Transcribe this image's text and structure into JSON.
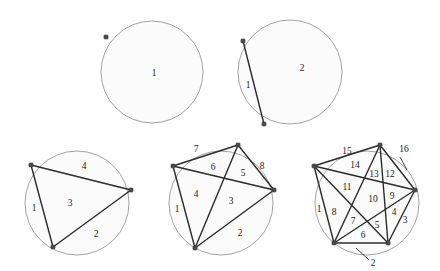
{
  "figure": {
    "background_color": "#ffffff",
    "circle_fill": "#fbfbfb",
    "circle_stroke": "#9a9a9a",
    "chord_color": "#2b2b2b",
    "vertex_color": "#4a4a4a",
    "label_color": "#1c1c1c",
    "panels": [
      {
        "name": "panel-1-point",
        "points_count": 1,
        "regions_count": 1,
        "center": {
          "x": 152,
          "y": 72
        },
        "radius": 51,
        "vertices": [
          {
            "x": 106,
            "y": 37
          }
        ],
        "chords": [],
        "region_labels": [
          {
            "text": "1",
            "x": 154,
            "y": 74
          }
        ],
        "leaders": []
      },
      {
        "name": "panel-2-points",
        "points_count": 2,
        "regions_count": 2,
        "center": {
          "x": 290,
          "y": 72
        },
        "radius": 52,
        "vertices": [
          {
            "x": 243,
            "y": 41
          },
          {
            "x": 264,
            "y": 124
          }
        ],
        "chords": [
          {
            "from": 0,
            "to": 1
          }
        ],
        "region_labels": [
          {
            "text": "1",
            "x": 248,
            "y": 86
          },
          {
            "text": "2",
            "x": 302,
            "y": 69
          }
        ],
        "leaders": []
      },
      {
        "name": "panel-3-points",
        "points_count": 3,
        "regions_count": 4,
        "center": {
          "x": 77,
          "y": 203
        },
        "radius": 52,
        "vertices": [
          {
            "x": 31,
            "y": 165
          },
          {
            "x": 131,
            "y": 190
          },
          {
            "x": 53,
            "y": 247
          }
        ],
        "chords": [
          {
            "from": 0,
            "to": 1
          },
          {
            "from": 1,
            "to": 2
          },
          {
            "from": 2,
            "to": 0
          }
        ],
        "region_labels": [
          {
            "text": "1",
            "x": 34,
            "y": 209
          },
          {
            "text": "2",
            "x": 96,
            "y": 235
          },
          {
            "text": "3",
            "x": 70,
            "y": 204
          },
          {
            "text": "4",
            "x": 84,
            "y": 167
          }
        ],
        "leaders": []
      },
      {
        "name": "panel-4-points",
        "points_count": 4,
        "regions_count": 8,
        "center": {
          "x": 221,
          "y": 203
        },
        "radius": 52,
        "vertices": [
          {
            "x": 173,
            "y": 166
          },
          {
            "x": 238,
            "y": 145
          },
          {
            "x": 274,
            "y": 190
          },
          {
            "x": 195,
            "y": 248
          }
        ],
        "chords": [
          {
            "from": 0,
            "to": 1
          },
          {
            "from": 0,
            "to": 2
          },
          {
            "from": 0,
            "to": 3
          },
          {
            "from": 1,
            "to": 2
          },
          {
            "from": 1,
            "to": 3
          },
          {
            "from": 2,
            "to": 3
          }
        ],
        "region_labels": [
          {
            "text": "1",
            "x": 177,
            "y": 210
          },
          {
            "text": "2",
            "x": 240,
            "y": 234
          },
          {
            "text": "3",
            "x": 231,
            "y": 202
          },
          {
            "text": "4",
            "x": 196,
            "y": 195
          },
          {
            "text": "5",
            "x": 243,
            "y": 174
          },
          {
            "text": "6",
            "x": 213,
            "y": 168
          },
          {
            "text": "7",
            "x": 196,
            "y": 150
          },
          {
            "text": "8",
            "x": 262,
            "y": 167
          }
        ],
        "leaders": []
      },
      {
        "name": "panel-5-points",
        "points_count": 5,
        "regions_count": 16,
        "center": {
          "x": 367,
          "y": 203
        },
        "radius": 52,
        "vertices": [
          {
            "x": 314,
            "y": 166
          },
          {
            "x": 380,
            "y": 145
          },
          {
            "x": 415,
            "y": 190
          },
          {
            "x": 388,
            "y": 243
          },
          {
            "x": 334,
            "y": 243
          }
        ],
        "chords": [
          {
            "from": 0,
            "to": 1
          },
          {
            "from": 0,
            "to": 2
          },
          {
            "from": 0,
            "to": 3
          },
          {
            "from": 0,
            "to": 4
          },
          {
            "from": 1,
            "to": 2
          },
          {
            "from": 1,
            "to": 3
          },
          {
            "from": 1,
            "to": 4
          },
          {
            "from": 2,
            "to": 3
          },
          {
            "from": 2,
            "to": 4
          },
          {
            "from": 3,
            "to": 4
          }
        ],
        "region_labels": [
          {
            "text": "1",
            "x": 319,
            "y": 210
          },
          {
            "text": "2",
            "x": 373,
            "y": 264
          },
          {
            "text": "3",
            "x": 405,
            "y": 221
          },
          {
            "text": "4",
            "x": 394,
            "y": 213
          },
          {
            "text": "5",
            "x": 377,
            "y": 226
          },
          {
            "text": "6",
            "x": 363,
            "y": 236
          },
          {
            "text": "7",
            "x": 353,
            "y": 222
          },
          {
            "text": "8",
            "x": 334,
            "y": 213
          },
          {
            "text": "9",
            "x": 392,
            "y": 197
          },
          {
            "text": "10",
            "x": 373,
            "y": 200
          },
          {
            "text": "11",
            "x": 347,
            "y": 188
          },
          {
            "text": "12",
            "x": 390,
            "y": 175
          },
          {
            "text": "13",
            "x": 374,
            "y": 175
          },
          {
            "text": "14",
            "x": 355,
            "y": 166
          },
          {
            "text": "15",
            "x": 347,
            "y": 152
          },
          {
            "text": "16",
            "x": 404,
            "y": 150
          }
        ],
        "leaders": [
          {
            "name": "leader-region-16",
            "x1": 400,
            "y1": 157,
            "x2": 407,
            "y2": 170
          },
          {
            "name": "leader-region-2",
            "x1": 369,
            "y1": 260,
            "x2": 356,
            "y2": 248
          }
        ]
      }
    ]
  }
}
